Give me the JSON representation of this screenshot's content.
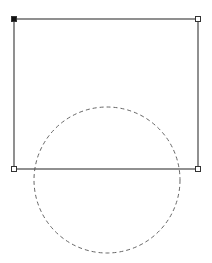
{
  "canvas": {
    "width": 212,
    "height": 263,
    "background": "#ffffff"
  },
  "rectangle": {
    "x": 14,
    "y": 19,
    "width": 184,
    "height": 150,
    "stroke": "#555555",
    "stroke_width": 1.3
  },
  "handles": [
    {
      "name": "top-left",
      "x": 14,
      "y": 19,
      "filled": true
    },
    {
      "name": "top-right",
      "x": 198,
      "y": 19,
      "filled": false
    },
    {
      "name": "bottom-left",
      "x": 14,
      "y": 169,
      "filled": false
    },
    {
      "name": "bottom-right",
      "x": 198,
      "y": 169,
      "filled": false
    }
  ],
  "handle_style": {
    "size": 5,
    "stroke": "#333333",
    "fill_selected": "#111111",
    "fill_unselected": "#ffffff"
  },
  "circle": {
    "cx": 107,
    "cy": 180,
    "r": 73,
    "stroke": "#666666",
    "stroke_width": 1,
    "dash": "4 3"
  }
}
